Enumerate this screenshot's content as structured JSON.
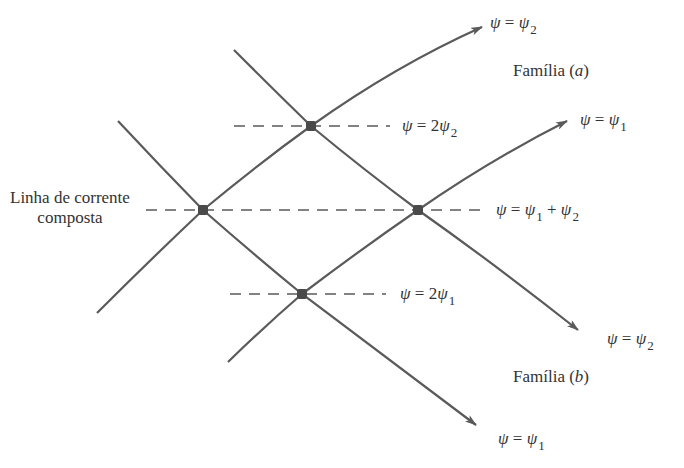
{
  "diagram": {
    "type": "superposition of streamlines",
    "families": [
      {
        "id": "a",
        "label": "Família (a)",
        "letter": "a"
      },
      {
        "id": "b",
        "label": "Família (b)",
        "letter": "b"
      }
    ],
    "curves": [
      {
        "id": "a-psi2",
        "family": "a",
        "label": "ψ = ψ2",
        "psi": "ψ",
        "eq": "=",
        "rhs": "ψ",
        "sub": "2"
      },
      {
        "id": "a-psi1",
        "family": "a",
        "label": "ψ = ψ1",
        "psi": "ψ",
        "eq": "=",
        "rhs": "ψ",
        "sub": "1"
      },
      {
        "id": "b-psi2",
        "family": "b",
        "label": "ψ = ψ2",
        "psi": "ψ",
        "eq": "=",
        "rhs": "ψ",
        "sub": "2"
      },
      {
        "id": "b-psi1",
        "family": "b",
        "label": "ψ = ψ1",
        "psi": "ψ",
        "eq": "=",
        "rhs": "ψ",
        "sub": "1"
      }
    ],
    "composite_lines": [
      {
        "id": "c-2psi2",
        "label": "ψ = 2ψ2",
        "psi": "ψ",
        "eq": "= 2",
        "rhs": "ψ",
        "sub": "2"
      },
      {
        "id": "c-sum",
        "label": "ψ = ψ1 + ψ2",
        "psi": "ψ",
        "eq": "=",
        "rhs": "ψ",
        "sub": "1",
        "plus": "+",
        "rhs2": "ψ",
        "sub2": "2"
      },
      {
        "id": "c-2psi1",
        "label": "ψ = 2ψ1",
        "psi": "ψ",
        "eq": "= 2",
        "rhs": "ψ",
        "sub": "1"
      }
    ],
    "composite_caption": {
      "line1": "Linha de corrente",
      "line2": "composta"
    },
    "families_labels": {
      "a": {
        "word": "Família (",
        "letter": "a",
        "close": ")"
      },
      "b": {
        "word": "Família (",
        "letter": "b",
        "close": ")"
      }
    },
    "intersections": [
      {
        "id": "p-top",
        "x": 311,
        "y": 126
      },
      {
        "id": "p-left",
        "x": 203,
        "y": 210
      },
      {
        "id": "p-right",
        "x": 418,
        "y": 210
      },
      {
        "id": "p-bottom",
        "x": 302,
        "y": 294
      }
    ]
  }
}
